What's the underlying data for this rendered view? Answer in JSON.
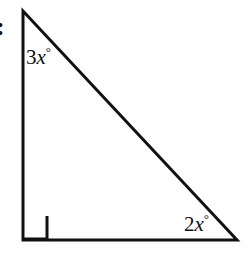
{
  "figure": {
    "name": "right-triangle-angle-diagram",
    "background_color": "#ffffff",
    "stroke_color": "#111111",
    "stroke_width": 3,
    "width": 249,
    "height": 255
  },
  "item_marker": {
    "text": ":"
  },
  "triangle": {
    "vertices": {
      "apex": {
        "x": 23,
        "y": 11
      },
      "bottom_left": {
        "x": 23,
        "y": 240
      },
      "bottom_right": {
        "x": 237,
        "y": 240
      }
    },
    "points_attr": "23,11 23,240 237,240"
  },
  "right_angle_marker": {
    "description": "open square marking 90 degree angle at bottom-left vertex",
    "size": 24,
    "path_attr": "M 47,216 L 47,240 M 23,238.5 L 47,238.5",
    "corner_path": "M 47,216 L 47,239 L 23,239"
  },
  "labels": {
    "apex_angle": {
      "coefficient": "3",
      "variable": "x",
      "degree": "°",
      "full_text": "3x°"
    },
    "bottom_right_angle": {
      "coefficient": "2",
      "variable": "x",
      "degree": "°",
      "full_text": "2x°"
    }
  }
}
